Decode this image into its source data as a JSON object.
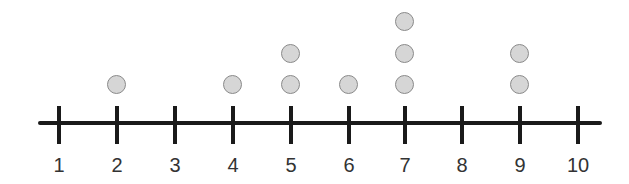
{
  "chart_data": {
    "type": "dot",
    "title": "",
    "xlabel": "",
    "ylabel": "",
    "categories": [
      1,
      2,
      3,
      4,
      5,
      6,
      7,
      8,
      9,
      10
    ],
    "values": [
      0,
      1,
      0,
      1,
      2,
      1,
      3,
      0,
      2,
      0
    ],
    "tick_labels": [
      "1",
      "2",
      "3",
      "4",
      "5",
      "6",
      "7",
      "8",
      "9",
      "10"
    ],
    "xlim": [
      1,
      10
    ],
    "grid": false,
    "legend": null,
    "colors": {
      "dot_fill": "#d6d6d6",
      "dot_stroke": "#8a8a8a",
      "axis": "#1a1a1a",
      "label": "#333333"
    }
  }
}
